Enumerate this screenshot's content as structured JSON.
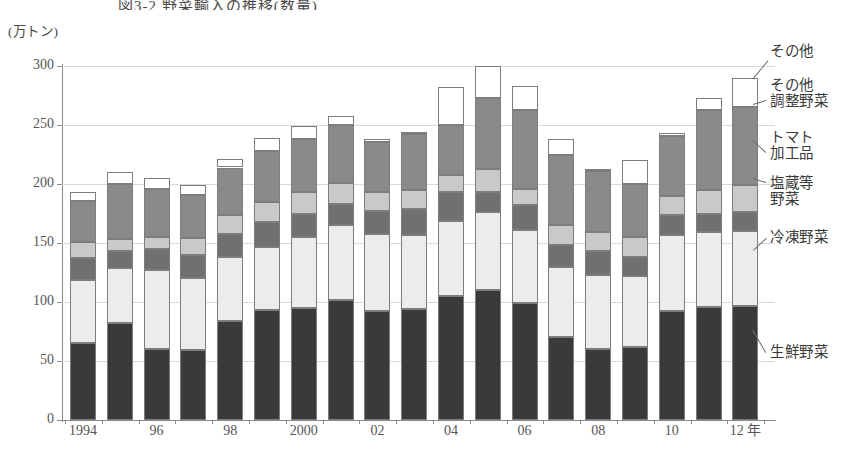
{
  "figure": {
    "title": "図3-2 野菜輸入の推移(数量)",
    "unit_label": "(万トン)"
  },
  "chart_data": {
    "type": "bar",
    "stacked": true,
    "title": "図3-2 野菜輸入の推移(数量)",
    "xlabel": "年",
    "ylabel": "万トン",
    "ylim": [
      0,
      300
    ],
    "yticks": [
      0,
      50,
      100,
      150,
      200,
      250,
      300
    ],
    "grid": true,
    "legend_position": "right-callouts",
    "categories": [
      "1994",
      "95",
      "96",
      "97",
      "98",
      "99",
      "2000",
      "01",
      "02",
      "03",
      "04",
      "05",
      "06",
      "07",
      "08",
      "09",
      "10",
      "11",
      "12"
    ],
    "tick_labels": [
      "1994",
      "",
      "96",
      "",
      "98",
      "",
      "2000",
      "",
      "02",
      "",
      "04",
      "",
      "06",
      "",
      "08",
      "",
      "10",
      "",
      "12 年"
    ],
    "series": [
      {
        "name": "生鮮野菜",
        "color": "#3a3a3a",
        "values": [
          65,
          82,
          60,
          59,
          84,
          93,
          95,
          102,
          92,
          94,
          105,
          110,
          99,
          70,
          60,
          62,
          92,
          96,
          97
        ]
      },
      {
        "name": "冷凍野菜",
        "color": "#ececec",
        "values": [
          54,
          47,
          67,
          61,
          54,
          54,
          60,
          63,
          66,
          63,
          64,
          66,
          62,
          60,
          63,
          60,
          65,
          63,
          63
        ]
      },
      {
        "name": "塩蔵等野菜",
        "color": "#707070",
        "values": [
          18,
          14,
          18,
          20,
          20,
          21,
          20,
          18,
          19,
          22,
          24,
          17,
          21,
          18,
          20,
          16,
          17,
          16,
          16
        ]
      },
      {
        "name": "トマト加工品",
        "color": "#c9c9c9",
        "values": [
          14,
          10,
          10,
          14,
          16,
          17,
          18,
          18,
          16,
          16,
          15,
          20,
          14,
          17,
          16,
          17,
          16,
          20,
          23
        ]
      },
      {
        "name": "その他調整野菜",
        "color": "#8a8a8a",
        "values": [
          35,
          47,
          41,
          37,
          40,
          43,
          45,
          49,
          43,
          47,
          42,
          60,
          67,
          60,
          52,
          45,
          51,
          68,
          66
        ]
      },
      {
        "name": "その他",
        "color": "#ffffff",
        "values": [
          7,
          10,
          9,
          8,
          7,
          11,
          11,
          8,
          2,
          1,
          32,
          27,
          20,
          13,
          1,
          20,
          2,
          10,
          25
        ]
      }
    ]
  },
  "legend": {
    "items": [
      {
        "label": "その他",
        "key": "other"
      },
      {
        "label": "その他\n調整野菜",
        "key": "other-prepared-vegetables"
      },
      {
        "label": "トマト\n加工品",
        "key": "tomato-products"
      },
      {
        "label": "塩蔵等\n野菜",
        "key": "salted-vegetables"
      },
      {
        "label": "冷凍野菜",
        "key": "frozen-vegetables"
      },
      {
        "label": "生鮮野菜",
        "key": "fresh-vegetables"
      }
    ]
  }
}
